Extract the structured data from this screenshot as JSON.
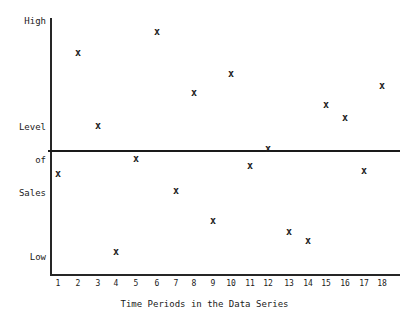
{
  "chart_data": {
    "type": "scatter",
    "title": "",
    "subtitle": "",
    "xlabel": "Time Periods in the Data Series",
    "ylabel": "Level of Sales",
    "ylabel_lines": [
      "Level",
      "of",
      "Sales"
    ],
    "y_axis_top_label": "High",
    "y_axis_bottom_label": "Low",
    "x": [
      1,
      2,
      3,
      4,
      5,
      6,
      7,
      8,
      9,
      10,
      11,
      12,
      13,
      14,
      15,
      16,
      17,
      18
    ],
    "categories": [
      "1",
      "2",
      "3",
      "4",
      "5",
      "6",
      "7",
      "8",
      "9",
      "10",
      "11",
      "12",
      "13",
      "14",
      "15",
      "16",
      "17",
      "18"
    ],
    "values": [
      40,
      87,
      58,
      9,
      46,
      95,
      33,
      72,
      21,
      79,
      43,
      49,
      17,
      13,
      67,
      62,
      41,
      74
    ],
    "marker": "x",
    "marker_glyph": "x",
    "marker_color": "#1f1f1f",
    "xlim": [
      0.5,
      18.5
    ],
    "ylim": [
      0,
      100
    ],
    "grid": false,
    "legend": false,
    "legend_position": "none",
    "annotations": [
      {
        "name": "trend-line",
        "type": "horizontal-line",
        "value": 51,
        "color": "#1a1a1a",
        "label": ""
      }
    ],
    "axis_color": "#262626",
    "background_color": "#ffffff",
    "points_pixels": [
      {
        "label": "1",
        "px": 58,
        "py": 173
      },
      {
        "label": "2",
        "px": 78,
        "py": 52
      },
      {
        "label": "3",
        "px": 98,
        "py": 125
      },
      {
        "label": "4",
        "px": 116,
        "py": 251
      },
      {
        "label": "5",
        "px": 136,
        "py": 158
      },
      {
        "label": "6",
        "px": 157,
        "py": 31
      },
      {
        "label": "7",
        "px": 176,
        "py": 190
      },
      {
        "label": "8",
        "px": 194,
        "py": 92
      },
      {
        "label": "9",
        "px": 213,
        "py": 220
      },
      {
        "label": "10",
        "px": 231,
        "py": 73
      },
      {
        "label": "11",
        "px": 250,
        "py": 165
      },
      {
        "label": "12",
        "px": 268,
        "py": 148
      },
      {
        "label": "13",
        "px": 289,
        "py": 231
      },
      {
        "label": "14",
        "px": 308,
        "py": 240
      },
      {
        "label": "15",
        "px": 326,
        "py": 104
      },
      {
        "label": "16",
        "px": 345,
        "py": 117
      },
      {
        "label": "17",
        "px": 364,
        "py": 170
      },
      {
        "label": "18",
        "px": 382,
        "py": 85
      }
    ]
  }
}
